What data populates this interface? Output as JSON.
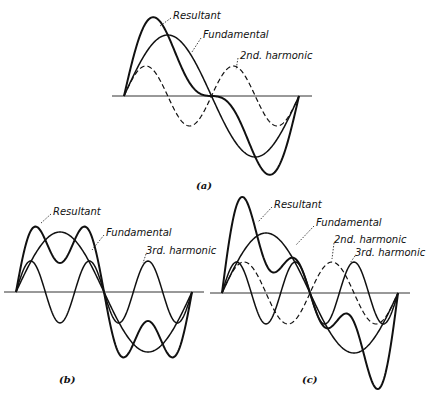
{
  "figure": {
    "panels": [
      {
        "id": "a",
        "caption": "(a)",
        "axis": {
          "y": 96,
          "x_start": 112,
          "x_end": 312
        },
        "wave": {
          "x0": 124,
          "x1": 299
        },
        "curves": [
          {
            "name": "Fundamental",
            "harmonics": [
              [
                1,
                61
              ]
            ],
            "dashed": false,
            "width": 1.5
          },
          {
            "name": "2nd. harmonic",
            "harmonics": [
              [
                2,
                30
              ]
            ],
            "dashed": true,
            "width": 1.2
          },
          {
            "name": "Resultant",
            "harmonics": [
              [
                1,
                61
              ],
              [
                2,
                30
              ]
            ],
            "dashed": false,
            "width": 2
          }
        ],
        "labels": [
          {
            "text": "Resultant",
            "x": 173,
            "y": 19,
            "lx1": 171,
            "ly1": 18,
            "lx2": 160,
            "ly2": 26
          },
          {
            "text": "Fundamental",
            "x": 203,
            "y": 38,
            "lx1": 201,
            "ly1": 38,
            "lx2": 192,
            "ly2": 52
          },
          {
            "text": "2nd. harmonic",
            "x": 240,
            "y": 59,
            "lx1": 238,
            "ly1": 58,
            "lx2": 236,
            "ly2": 70
          }
        ],
        "caption_pos": {
          "x": 196,
          "y": 189
        }
      },
      {
        "id": "b",
        "caption": "(b)",
        "axis": {
          "y": 292,
          "x_start": 4,
          "x_end": 204
        },
        "wave": {
          "x0": 16,
          "x1": 192
        },
        "curves": [
          {
            "name": "Fundamental",
            "harmonics": [
              [
                1,
                60
              ]
            ],
            "dashed": false,
            "width": 1.5
          },
          {
            "name": "3rd. harmonic",
            "harmonics": [
              [
                3,
                31
              ]
            ],
            "dashed": false,
            "width": 1.5
          },
          {
            "name": "Resultant",
            "harmonics": [
              [
                1,
                60
              ],
              [
                3,
                31
              ]
            ],
            "dashed": false,
            "width": 2
          }
        ],
        "labels": [
          {
            "text": "Resultant",
            "x": 53,
            "y": 215,
            "lx1": 51,
            "ly1": 214,
            "lx2": 40,
            "ly2": 224
          },
          {
            "text": "Fundamental",
            "x": 106,
            "y": 236,
            "lx1": 104,
            "ly1": 235,
            "lx2": 92,
            "ly2": 250
          },
          {
            "text": "3rd. harmonic",
            "x": 146,
            "y": 254,
            "lx1": 146,
            "ly1": 254,
            "lx2": 143,
            "ly2": 263
          }
        ],
        "caption_pos": {
          "x": 59,
          "y": 383
        }
      },
      {
        "id": "c",
        "caption": "(c)",
        "axis": {
          "y": 293,
          "x_start": 210,
          "x_end": 410
        },
        "wave": {
          "x0": 222,
          "x1": 398
        },
        "curves": [
          {
            "name": "Fundamental",
            "harmonics": [
              [
                1,
                60
              ]
            ],
            "dashed": false,
            "width": 1.5
          },
          {
            "name": "2nd. harmonic",
            "harmonics": [
              [
                2,
                31
              ]
            ],
            "dashed": true,
            "width": 1.2
          },
          {
            "name": "3rd. harmonic",
            "harmonics": [
              [
                3,
                31
              ]
            ],
            "dashed": false,
            "width": 1.5
          },
          {
            "name": "Resultant",
            "harmonics": [
              [
                1,
                60
              ],
              [
                2,
                31
              ],
              [
                3,
                31
              ]
            ],
            "dashed": false,
            "width": 2
          }
        ],
        "labels": [
          {
            "text": "Resultant",
            "x": 274,
            "y": 208,
            "lx1": 272,
            "ly1": 207,
            "lx2": 258,
            "ly2": 222
          },
          {
            "text": "Fundamental",
            "x": 316,
            "y": 226,
            "lx1": 314,
            "ly1": 226,
            "lx2": 296,
            "ly2": 245
          },
          {
            "text": "2nd. harmonic",
            "x": 334,
            "y": 243,
            "lx1": 334,
            "ly1": 243,
            "lx2": 332,
            "ly2": 259
          },
          {
            "text": "3rd. harmonic",
            "x": 355,
            "y": 256,
            "lx1": 355,
            "ly1": 256,
            "lx2": 350,
            "ly2": 263
          }
        ],
        "caption_pos": {
          "x": 302,
          "y": 383
        }
      }
    ],
    "colors": {
      "ink": "#111111",
      "axis": "#333333",
      "background": "#ffffff"
    }
  }
}
